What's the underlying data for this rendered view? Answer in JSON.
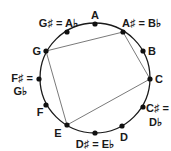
{
  "diagram": {
    "center": [
      95,
      78
    ],
    "radius": 55,
    "colors": {
      "circle": "#1a1a1a",
      "polygon": "#7a7a7a",
      "dot": "#111111",
      "text": "#1a1a1a"
    },
    "notes": [
      {
        "id": "A",
        "pos": [
          95,
          24
        ],
        "label_lines": [
          "A"
        ]
      },
      {
        "id": "As",
        "pos": [
          123,
          32
        ],
        "label_lines": [
          "A♯ = B♭"
        ]
      },
      {
        "id": "B",
        "pos": [
          143,
          51
        ],
        "label_lines": [
          "B"
        ]
      },
      {
        "id": "C",
        "pos": [
          150,
          79
        ],
        "label_lines": [
          "C"
        ]
      },
      {
        "id": "Cs",
        "pos": [
          143,
          107
        ],
        "label_lines": [
          "C♯ =",
          "D♭"
        ]
      },
      {
        "id": "D",
        "pos": [
          122,
          126
        ],
        "label_lines": [
          "D"
        ]
      },
      {
        "id": "Ds",
        "pos": [
          95,
          133
        ],
        "label_lines": [
          "D♯ = E♭"
        ]
      },
      {
        "id": "E",
        "pos": [
          67,
          125
        ],
        "label_lines": [
          "E"
        ]
      },
      {
        "id": "F",
        "pos": [
          46,
          105
        ],
        "label_lines": [
          "F"
        ]
      },
      {
        "id": "Fs",
        "pos": [
          39,
          79
        ],
        "label_lines": [
          "F♯ =",
          "G♭"
        ]
      },
      {
        "id": "G",
        "pos": [
          46,
          51
        ],
        "label_lines": [
          "G"
        ]
      },
      {
        "id": "Gs",
        "pos": [
          67,
          32
        ],
        "label_lines": [
          "G♯ = A♭"
        ]
      }
    ],
    "polygon": [
      "G",
      "As",
      "C",
      "E"
    ],
    "labels": {
      "A": "A",
      "As": "A♯ = B♭",
      "B": "B",
      "C": "C",
      "Cs_1": "C♯ =",
      "Cs_2": "D♭",
      "D": "D",
      "Ds": "D♯ = E♭",
      "E": "E",
      "F": "F",
      "Fs_1": "F♯ =",
      "Fs_2": "G♭",
      "G": "G",
      "Gs": "G♯ = A♭"
    }
  }
}
